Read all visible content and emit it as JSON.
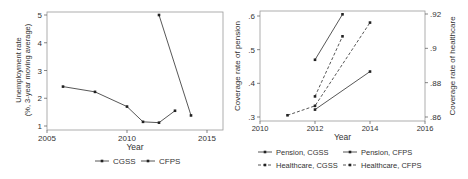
{
  "chart_data": [
    {
      "type": "line",
      "title": "",
      "xlabel": "Year",
      "ylabel": "Unemployment rate (%, 3-year moving average)",
      "ylabel_lines": [
        "Unemployment rate",
        "(%, 3-year moving average)"
      ],
      "xlim": [
        2005,
        2016
      ],
      "ylim": [
        1,
        5
      ],
      "xticks": [
        2005,
        2010,
        2015
      ],
      "yticks": [
        1,
        2,
        3,
        4,
        5
      ],
      "legend_position": "bottom",
      "series": [
        {
          "name": "CGSS",
          "x": [
            2006,
            2008,
            2010,
            2011,
            2012,
            2013
          ],
          "y": [
            2.42,
            2.23,
            1.7,
            1.15,
            1.12,
            1.55
          ]
        },
        {
          "name": "CFPS",
          "x": [
            2012,
            2014
          ],
          "y": [
            5.0,
            1.38
          ]
        }
      ]
    },
    {
      "type": "line",
      "title": "",
      "xlabel": "Year",
      "ylabel": "Coverage rate of pension",
      "ylabel_right": "Coverage rate of healthcare",
      "xlim": [
        2010,
        2016
      ],
      "ylim": [
        0.3,
        0.6
      ],
      "ylim_right": [
        0.86,
        0.92
      ],
      "xticks": [
        2010,
        2012,
        2014,
        2016
      ],
      "yticks": [
        ".3",
        ".4",
        ".5",
        ".6"
      ],
      "yticks_right": [
        ".86",
        ".88",
        ".9",
        ".92"
      ],
      "legend_position": "bottom",
      "series": [
        {
          "name": "Pension, CGSS",
          "axis": "left",
          "style": "solid",
          "x": [
            2012,
            2013
          ],
          "y": [
            0.47,
            0.605
          ]
        },
        {
          "name": "Pension, CFPS",
          "axis": "left",
          "style": "solid",
          "x": [
            2012,
            2014
          ],
          "y": [
            0.322,
            0.435
          ]
        },
        {
          "name": "Healthcare, CGSS",
          "axis": "right",
          "style": "dashed",
          "x": [
            2012,
            2013
          ],
          "y": [
            0.872,
            0.907
          ]
        },
        {
          "name": "Healthcare, CFPS",
          "axis": "right",
          "style": "dashed",
          "x": [
            2011,
            2012,
            2014
          ],
          "y": [
            0.861,
            0.8665,
            0.915
          ]
        }
      ]
    }
  ]
}
